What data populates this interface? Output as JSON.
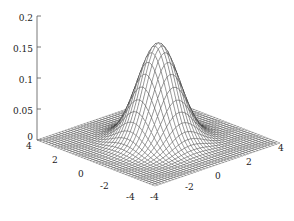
{
  "figure": {
    "kind": "surface-mesh-plot",
    "background_color": "#ffffff",
    "mesh_color": "#2b2b2b",
    "axis_color": "#555555",
    "label_color": "#1a1a1a"
  },
  "chart_data": {
    "type": "surface",
    "title": "",
    "subtitle": "",
    "xlabel": "",
    "ylabel": "",
    "zlabel": "",
    "grid": false,
    "legend": false,
    "legend_position": "none",
    "function": "bivariate standard normal probability density",
    "formula": "z = (1/(2*pi)) * exp(-(x^2 + y^2)/2)",
    "peak_value": 0.1592,
    "peak_location": [
      0,
      0
    ],
    "xlim": [
      -4,
      4
    ],
    "ylim": [
      -4,
      4
    ],
    "zlim": [
      0,
      0.2
    ],
    "x_ticks": [
      -4,
      -2,
      0,
      2,
      4
    ],
    "y_ticks": [
      -4,
      -2,
      0,
      2,
      4
    ],
    "z_ticks": [
      0,
      0.05,
      0.1,
      0.15,
      0.2
    ],
    "x_tick_labels": [
      "-4",
      "-2",
      "0",
      "2",
      "4"
    ],
    "y_tick_labels": [
      "4",
      "2",
      "0",
      "-2",
      "-4"
    ],
    "z_tick_labels": [
      "0",
      "0.05",
      "0.1",
      "0.15",
      "0.2"
    ],
    "mesh_divisions": 40,
    "view": {
      "azimuth": -37.5,
      "elevation": 30
    }
  },
  "axes": {
    "z": {
      "ticks": [
        {
          "value": 0.2,
          "label": "0.2"
        },
        {
          "value": 0.15,
          "label": "0.15"
        },
        {
          "value": 0.1,
          "label": "0.1"
        },
        {
          "value": 0.05,
          "label": "0.05"
        },
        {
          "value": 0.0,
          "label": "0"
        }
      ]
    },
    "left_horizontal": {
      "ticks": [
        {
          "value": 4,
          "label": "4"
        },
        {
          "value": 2,
          "label": "2"
        },
        {
          "value": 0,
          "label": "0"
        },
        {
          "value": -2,
          "label": "-2"
        },
        {
          "value": -4,
          "label": "-4"
        }
      ]
    },
    "right_horizontal": {
      "ticks": [
        {
          "value": -4,
          "label": "-4"
        },
        {
          "value": -2,
          "label": "-2"
        },
        {
          "value": 0,
          "label": "0"
        },
        {
          "value": 2,
          "label": "2"
        },
        {
          "value": 4,
          "label": "4"
        }
      ]
    }
  }
}
